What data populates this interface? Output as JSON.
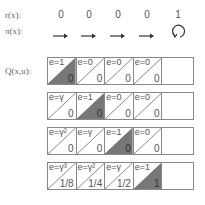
{
  "labels": {
    "reward": "r(x):",
    "policy": "π(x):",
    "q": "Q(x,u):"
  },
  "rewards": [
    "0",
    "0",
    "0",
    "0",
    "1"
  ],
  "policy": [
    "arrow-right",
    "arrow-right",
    "arrow-right",
    "arrow-right",
    "self-loop"
  ],
  "colors": {
    "highlight": "#777777",
    "border": "#888888",
    "text": "#555555"
  },
  "rows": [
    {
      "cells": [
        {
          "e": "e=1",
          "q": "0",
          "shaded": true
        },
        {
          "e": "e=0",
          "q": "0",
          "shaded": false
        },
        {
          "e": "e=0",
          "q": "0",
          "shaded": false
        },
        {
          "e": "e=0",
          "q": "0",
          "shaded": false
        },
        {
          "e": "",
          "q": "",
          "shaded": false,
          "empty": true
        }
      ]
    },
    {
      "cells": [
        {
          "e": "e=γ",
          "q": "0",
          "shaded": false
        },
        {
          "e": "e=1",
          "q": "0",
          "shaded": true
        },
        {
          "e": "e=0",
          "q": "0",
          "shaded": false
        },
        {
          "e": "e=0",
          "q": "0",
          "shaded": false
        },
        {
          "e": "",
          "q": "",
          "shaded": false,
          "empty": true
        }
      ]
    },
    {
      "cells": [
        {
          "e": "e=γ²",
          "q": "0",
          "shaded": false
        },
        {
          "e": "e=γ",
          "q": "0",
          "shaded": false
        },
        {
          "e": "e=1",
          "q": "0",
          "shaded": true
        },
        {
          "e": "e=0",
          "q": "0",
          "shaded": false
        },
        {
          "e": "",
          "q": "",
          "shaded": false,
          "empty": true
        }
      ]
    },
    {
      "cells": [
        {
          "e": "e=γ³",
          "q": "1/8",
          "shaded": false
        },
        {
          "e": "e=γ²",
          "q": "1/4",
          "shaded": false
        },
        {
          "e": "e=γ",
          "q": "1/2",
          "shaded": false
        },
        {
          "e": "e=1",
          "q": "1",
          "shaded": true
        },
        {
          "e": "",
          "q": "",
          "shaded": false,
          "empty": true
        }
      ]
    }
  ]
}
